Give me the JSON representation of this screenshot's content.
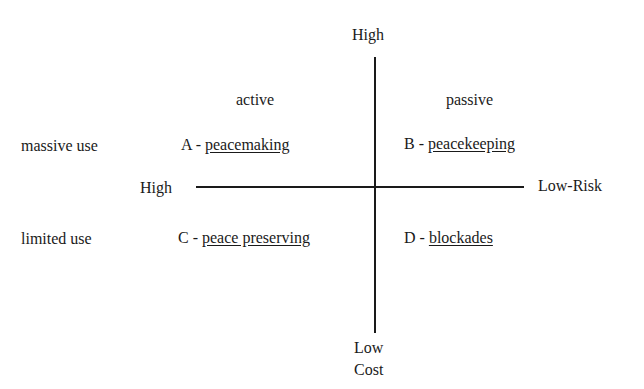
{
  "axes": {
    "vertical": {
      "top_label": "High",
      "bottom_label_1": "Low",
      "bottom_label_2": "Cost"
    },
    "horizontal": {
      "left_label": "High",
      "right_label": "Low-Risk"
    }
  },
  "columns": {
    "left": "active",
    "right": "passive"
  },
  "rows": {
    "top": "massive use",
    "bottom": "limited use"
  },
  "quadrants": {
    "A": {
      "letter": "A - ",
      "name": "peacemaking"
    },
    "B": {
      "letter": "B - ",
      "name": "peacekeeping"
    },
    "C": {
      "letter": "C - ",
      "name": "peace preserving"
    },
    "D": {
      "letter": "D - ",
      "name": "blockades"
    }
  }
}
